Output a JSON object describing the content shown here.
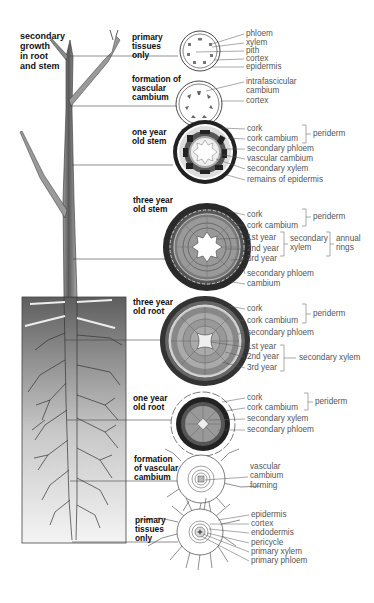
{
  "title": [
    "secondary",
    "growth",
    "in root",
    "and stem"
  ],
  "stages": [
    {
      "id": "stem-primary",
      "title": [
        "primary",
        "tissues",
        "only"
      ],
      "labels": [
        "phloem",
        "xylem",
        "pith",
        "cortex",
        "epidermis"
      ]
    },
    {
      "id": "stem-vascular-cambium",
      "title": [
        "formation of",
        "vascular",
        "cambium"
      ],
      "labels": [
        "intrafascicular",
        "cambium",
        "cortex"
      ]
    },
    {
      "id": "stem-one-year",
      "title": [
        "one year",
        "old stem"
      ],
      "labels": [
        "cork",
        "cork cambium",
        "secondary phloem",
        "vascular cambium",
        "secondary xylem",
        "remains of epidermis"
      ],
      "brackets": [
        {
          "label": "periderm",
          "covers": [
            "cork",
            "cork cambium"
          ]
        }
      ]
    },
    {
      "id": "stem-three-year",
      "title": [
        "three year",
        "old stem"
      ],
      "labels": [
        "cork",
        "cork cambium",
        "1st year",
        "2nd year",
        "3rd year",
        "secondary phloem",
        "cambium"
      ],
      "brackets": [
        {
          "label": "periderm",
          "covers": [
            "cork",
            "cork cambium"
          ]
        },
        {
          "label": [
            "secondary",
            "xylem"
          ],
          "covers": [
            "1st year",
            "2nd year",
            "3rd year"
          ]
        },
        {
          "label": [
            "annual",
            "rings"
          ],
          "covers": [
            "1st year",
            "2nd year",
            "3rd year"
          ]
        }
      ]
    },
    {
      "id": "root-three-year",
      "title": [
        "three year",
        "old root"
      ],
      "labels": [
        "cork",
        "cork cambium",
        "secondary phloem",
        "1st year",
        "2nd year",
        "3rd year"
      ],
      "brackets": [
        {
          "label": "periderm",
          "covers": [
            "cork",
            "cork cambium"
          ]
        },
        {
          "label": "secondary xylem",
          "covers": [
            "1st year",
            "2nd year",
            "3rd year"
          ]
        }
      ]
    },
    {
      "id": "root-one-year",
      "title": [
        "one year",
        "old root"
      ],
      "labels": [
        "cork",
        "cork cambium",
        "secondary xylem",
        "secondary phloem"
      ],
      "brackets": [
        {
          "label": "periderm",
          "covers": [
            "cork",
            "cork cambium"
          ]
        }
      ]
    },
    {
      "id": "root-vascular-cambium",
      "title": [
        "formation",
        "of vascular",
        "cambium"
      ],
      "labels": [
        "vascular",
        "cambium",
        "forming"
      ]
    },
    {
      "id": "root-primary",
      "title": [
        "primary",
        "tissues",
        "only"
      ],
      "labels": [
        "epidermis",
        "cortex",
        "endodermis",
        "pericycle",
        "primary xylem",
        "primary phloem"
      ]
    }
  ],
  "colors": {
    "ink": "#222222",
    "label_text": "#555555",
    "cork": "#2a2a2a",
    "phloem": "#6b6b6b",
    "xylem_ring": "#9a9a9a",
    "soil": "#8a8a8a"
  }
}
